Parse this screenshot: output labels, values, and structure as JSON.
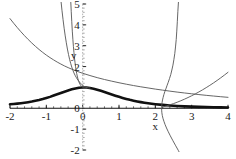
{
  "chart_data": {
    "type": "line",
    "title": "",
    "subtitle": "",
    "xlabel": "x",
    "ylabel": "y",
    "xlim": [
      -2,
      4
    ],
    "ylim": [
      -2,
      5
    ],
    "grid": false,
    "legend": "none",
    "x_ticks": [
      {
        "value": -2,
        "label": "-2"
      },
      {
        "value": -1,
        "label": "-1"
      },
      {
        "value": 0,
        "label": "0"
      },
      {
        "value": 1,
        "label": "1"
      },
      {
        "value": 2,
        "label": "2"
      },
      {
        "value": 3,
        "label": "3"
      },
      {
        "value": 4,
        "label": "4"
      }
    ],
    "y_ticks": [
      {
        "value": -2,
        "label": "-2"
      },
      {
        "value": -1,
        "label": "-1"
      },
      {
        "value": 0,
        "label": "0"
      },
      {
        "value": 2,
        "label": "2"
      },
      {
        "value": 3,
        "label": "3"
      },
      {
        "value": 4,
        "label": "4"
      },
      {
        "value": 5,
        "label": "5"
      }
    ],
    "x_minor_tick_step": 0.2,
    "y_minor_tick_step": 0.2,
    "series": [
      {
        "name": "bell-curve",
        "style": "thick-solid",
        "color": "#111111",
        "width": 2.6,
        "points": [
          [
            -2.0,
            0.19
          ],
          [
            -1.9,
            0.205
          ],
          [
            -1.8,
            0.222
          ],
          [
            -1.7,
            0.242
          ],
          [
            -1.6,
            0.265
          ],
          [
            -1.5,
            0.292
          ],
          [
            -1.4,
            0.322
          ],
          [
            -1.3,
            0.357
          ],
          [
            -1.2,
            0.396
          ],
          [
            -1.1,
            0.441
          ],
          [
            -1.0,
            0.492
          ],
          [
            -0.9,
            0.547
          ],
          [
            -0.8,
            0.608
          ],
          [
            -0.7,
            0.67
          ],
          [
            -0.6,
            0.734
          ],
          [
            -0.5,
            0.797
          ],
          [
            -0.4,
            0.855
          ],
          [
            -0.3,
            0.908
          ],
          [
            -0.2,
            0.952
          ],
          [
            -0.1,
            0.984
          ],
          [
            0.0,
            1.0
          ],
          [
            0.1,
            0.996
          ],
          [
            0.2,
            0.975
          ],
          [
            0.3,
            0.94
          ],
          [
            0.4,
            0.894
          ],
          [
            0.5,
            0.84
          ],
          [
            0.6,
            0.782
          ],
          [
            0.7,
            0.722
          ],
          [
            0.8,
            0.662
          ],
          [
            0.9,
            0.604
          ],
          [
            1.0,
            0.549
          ],
          [
            1.1,
            0.497
          ],
          [
            1.2,
            0.449
          ],
          [
            1.3,
            0.405
          ],
          [
            1.4,
            0.365
          ],
          [
            1.5,
            0.329
          ],
          [
            1.6,
            0.296
          ],
          [
            1.7,
            0.267
          ],
          [
            1.8,
            0.241
          ],
          [
            1.9,
            0.218
          ],
          [
            2.0,
            0.197
          ],
          [
            2.2,
            0.162
          ],
          [
            2.4,
            0.134
          ],
          [
            2.6,
            0.112
          ],
          [
            2.8,
            0.094
          ],
          [
            3.0,
            0.08
          ],
          [
            3.2,
            0.068
          ],
          [
            3.4,
            0.059
          ],
          [
            3.6,
            0.051
          ],
          [
            3.8,
            0.044
          ],
          [
            4.0,
            0.039
          ]
        ]
      },
      {
        "name": "descending-curve",
        "style": "thin-solid",
        "color": "#555555",
        "width": 0.9,
        "points": [
          [
            -2.0,
            4.3
          ],
          [
            -1.9,
            4.08
          ],
          [
            -1.8,
            3.87
          ],
          [
            -1.7,
            3.67
          ],
          [
            -1.6,
            3.48
          ],
          [
            -1.5,
            3.3
          ],
          [
            -1.4,
            3.13
          ],
          [
            -1.3,
            2.97
          ],
          [
            -1.2,
            2.82
          ],
          [
            -1.1,
            2.68
          ],
          [
            -1.0,
            2.55
          ],
          [
            -0.9,
            2.43
          ],
          [
            -0.8,
            2.32
          ],
          [
            -0.7,
            2.215
          ],
          [
            -0.6,
            2.12
          ],
          [
            -0.5,
            2.03
          ],
          [
            -0.4,
            1.95
          ],
          [
            -0.3,
            1.875
          ],
          [
            -0.2,
            1.805
          ],
          [
            -0.1,
            1.74
          ],
          [
            0.0,
            1.68
          ],
          [
            0.2,
            1.57
          ],
          [
            0.4,
            1.47
          ],
          [
            0.6,
            1.38
          ],
          [
            0.8,
            1.3
          ],
          [
            1.0,
            1.225
          ],
          [
            1.2,
            1.155
          ],
          [
            1.4,
            1.09
          ],
          [
            1.6,
            1.03
          ],
          [
            1.8,
            0.975
          ],
          [
            2.0,
            0.92
          ],
          [
            2.2,
            0.87
          ],
          [
            2.4,
            0.822
          ],
          [
            2.6,
            0.777
          ],
          [
            2.8,
            0.735
          ],
          [
            3.0,
            0.695
          ],
          [
            3.2,
            0.657
          ],
          [
            3.4,
            0.621
          ],
          [
            3.6,
            0.587
          ],
          [
            3.8,
            0.555
          ],
          [
            4.0,
            0.525
          ]
        ]
      },
      {
        "name": "steep-curve-left-outer",
        "style": "thin-solid",
        "color": "#555555",
        "width": 0.9,
        "points": [
          [
            -0.6,
            5.2
          ],
          [
            -0.57,
            4.7
          ],
          [
            -0.54,
            4.25
          ],
          [
            -0.51,
            3.84
          ],
          [
            -0.48,
            3.47
          ],
          [
            -0.45,
            3.14
          ],
          [
            -0.42,
            2.84
          ],
          [
            -0.39,
            2.58
          ],
          [
            -0.36,
            2.35
          ],
          [
            -0.33,
            2.15
          ],
          [
            -0.3,
            1.975
          ],
          [
            -0.27,
            1.825
          ],
          [
            -0.24,
            1.695
          ],
          [
            -0.21,
            1.585
          ],
          [
            -0.18,
            1.49
          ],
          [
            -0.15,
            1.405
          ],
          [
            -0.12,
            1.33
          ],
          [
            -0.09,
            1.262
          ],
          [
            -0.06,
            1.2
          ],
          [
            -0.03,
            1.145
          ],
          [
            0.0,
            1.095
          ],
          [
            0.04,
            1.048
          ],
          [
            0.08,
            1.012
          ],
          [
            0.12,
            0.99
          ],
          [
            0.16,
            0.978
          ],
          [
            0.2,
            0.975
          ]
        ]
      },
      {
        "name": "steep-curve-left-inner",
        "style": "thin-solid",
        "color": "#555555",
        "width": 0.9,
        "points": [
          [
            -0.33,
            5.2
          ],
          [
            -0.315,
            4.65
          ],
          [
            -0.3,
            4.15
          ],
          [
            -0.285,
            3.7
          ],
          [
            -0.27,
            3.31
          ],
          [
            -0.255,
            2.97
          ],
          [
            -0.24,
            2.67
          ],
          [
            -0.225,
            2.41
          ],
          [
            -0.21,
            2.185
          ],
          [
            -0.195,
            1.99
          ],
          [
            -0.18,
            1.82
          ],
          [
            -0.165,
            1.675
          ],
          [
            -0.15,
            1.55
          ],
          [
            -0.135,
            1.443
          ],
          [
            -0.12,
            1.352
          ],
          [
            -0.105,
            1.275
          ],
          [
            -0.09,
            1.21
          ],
          [
            -0.075,
            1.156
          ],
          [
            -0.06,
            1.112
          ],
          [
            -0.045,
            1.076
          ],
          [
            -0.03,
            1.047
          ],
          [
            -0.015,
            1.024
          ],
          [
            0.0,
            1.006
          ],
          [
            0.02,
            0.992
          ],
          [
            0.05,
            0.982
          ],
          [
            0.08,
            0.978
          ],
          [
            0.12,
            0.978
          ]
        ]
      },
      {
        "name": "s-curve-right",
        "style": "thin-solid",
        "color": "#555555",
        "width": 0.9,
        "points": [
          [
            2.64,
            5.2
          ],
          [
            2.62,
            4.65
          ],
          [
            2.605,
            4.15
          ],
          [
            2.59,
            3.7
          ],
          [
            2.575,
            3.3
          ],
          [
            2.555,
            2.94
          ],
          [
            2.535,
            2.62
          ],
          [
            2.51,
            2.33
          ],
          [
            2.485,
            2.07
          ],
          [
            2.455,
            1.835
          ],
          [
            2.425,
            1.62
          ],
          [
            2.39,
            1.425
          ],
          [
            2.355,
            1.245
          ],
          [
            2.32,
            1.08
          ],
          [
            2.29,
            0.93
          ],
          [
            2.26,
            0.79
          ],
          [
            2.235,
            0.655
          ],
          [
            2.215,
            0.525
          ],
          [
            2.198,
            0.4
          ],
          [
            2.186,
            0.275
          ],
          [
            2.178,
            0.15
          ],
          [
            2.174,
            0.03
          ],
          [
            2.174,
            -0.09
          ],
          [
            2.18,
            -0.215
          ],
          [
            2.192,
            -0.345
          ],
          [
            2.21,
            -0.48
          ],
          [
            2.236,
            -0.625
          ],
          [
            2.268,
            -0.78
          ],
          [
            2.308,
            -0.945
          ],
          [
            2.356,
            -1.125
          ],
          [
            2.412,
            -1.32
          ],
          [
            2.478,
            -1.535
          ],
          [
            2.552,
            -1.77
          ],
          [
            2.636,
            -2.03
          ],
          [
            2.7,
            -2.25
          ]
        ]
      },
      {
        "name": "rising-branch-right",
        "style": "thin-solid",
        "color": "#555555",
        "width": 0.9,
        "points": [
          [
            2.2,
            0.06
          ],
          [
            2.3,
            0.11
          ],
          [
            2.4,
            0.165
          ],
          [
            2.5,
            0.225
          ],
          [
            2.6,
            0.29
          ],
          [
            2.7,
            0.36
          ],
          [
            2.8,
            0.435
          ],
          [
            2.9,
            0.515
          ],
          [
            3.0,
            0.6
          ],
          [
            3.1,
            0.69
          ],
          [
            3.2,
            0.785
          ],
          [
            3.3,
            0.885
          ],
          [
            3.4,
            0.99
          ],
          [
            3.5,
            1.1
          ],
          [
            3.6,
            1.215
          ],
          [
            3.7,
            1.335
          ],
          [
            3.8,
            1.46
          ],
          [
            3.9,
            1.59
          ],
          [
            4.0,
            1.725
          ]
        ]
      }
    ]
  },
  "axes": {
    "x_axis_name": "x-axis",
    "y_axis_name": "y-axis"
  }
}
